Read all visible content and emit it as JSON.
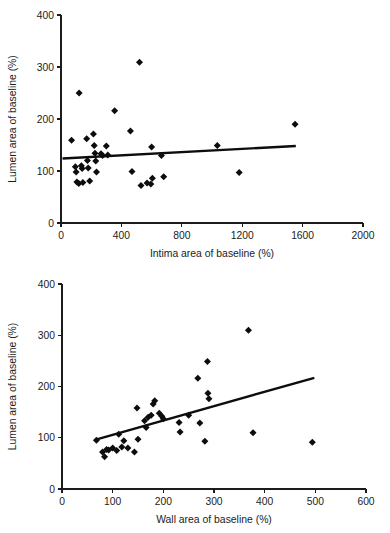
{
  "figure": {
    "title": "",
    "background": "#ffffff",
    "marker_color": "#0d0d0d",
    "axis_color": "#1b1b1b"
  },
  "chart_data": [
    {
      "type": "scatter",
      "title": "",
      "xlabel": "Intima area of baseline (%)",
      "ylabel": "Lumen area of baseline (%)",
      "xlim": [
        0,
        2000
      ],
      "ylim": [
        0,
        400
      ],
      "xticks": [
        0,
        400,
        800,
        1200,
        1600,
        2000
      ],
      "yticks": [
        0,
        100,
        200,
        300,
        400
      ],
      "xticklabels": [
        "0",
        "400",
        "800",
        "1200",
        "1600",
        "2000"
      ],
      "yticklabels": [
        "0",
        "100",
        "200",
        "300",
        "400"
      ],
      "grid": false,
      "legend": null,
      "marker": "diamond",
      "points": [
        [
          70,
          159
        ],
        [
          95,
          108
        ],
        [
          100,
          98
        ],
        [
          105,
          79
        ],
        [
          118,
          76
        ],
        [
          120,
          250
        ],
        [
          135,
          110
        ],
        [
          140,
          105
        ],
        [
          145,
          78
        ],
        [
          170,
          162
        ],
        [
          175,
          120
        ],
        [
          180,
          106
        ],
        [
          190,
          81
        ],
        [
          215,
          171
        ],
        [
          220,
          149
        ],
        [
          225,
          134
        ],
        [
          230,
          119
        ],
        [
          235,
          98
        ],
        [
          265,
          133
        ],
        [
          275,
          130
        ],
        [
          300,
          148
        ],
        [
          310,
          131
        ],
        [
          355,
          216
        ],
        [
          460,
          177
        ],
        [
          470,
          99
        ],
        [
          520,
          309
        ],
        [
          530,
          72
        ],
        [
          570,
          77
        ],
        [
          595,
          75
        ],
        [
          600,
          146
        ],
        [
          605,
          86
        ],
        [
          665,
          130
        ],
        [
          680,
          89
        ],
        [
          1035,
          149
        ],
        [
          1180,
          97
        ],
        [
          1550,
          190
        ]
      ],
      "trendline": {
        "x0": 10,
        "y0": 124,
        "x1": 1555,
        "y1": 148
      }
    },
    {
      "type": "scatter",
      "title": "",
      "xlabel": "Wall area of baseline (%)",
      "ylabel": "Lumen area of baseline (%)",
      "xlim": [
        0,
        600
      ],
      "ylim": [
        0,
        400
      ],
      "xticks": [
        0,
        100,
        200,
        300,
        400,
        500,
        600
      ],
      "yticks": [
        0,
        100,
        200,
        300,
        400
      ],
      "xticklabels": [
        "0",
        "100",
        "200",
        "300",
        "400",
        "500",
        "600"
      ],
      "yticklabels": [
        "0",
        "100",
        "200",
        "300",
        "400"
      ],
      "grid": false,
      "legend": null,
      "marker": "diamond",
      "points": [
        [
          68,
          95
        ],
        [
          80,
          72
        ],
        [
          84,
          63
        ],
        [
          88,
          77
        ],
        [
          92,
          76
        ],
        [
          100,
          80
        ],
        [
          108,
          75
        ],
        [
          112,
          107
        ],
        [
          118,
          82
        ],
        [
          122,
          94
        ],
        [
          130,
          80
        ],
        [
          143,
          72
        ],
        [
          148,
          158
        ],
        [
          150,
          97
        ],
        [
          163,
          133
        ],
        [
          166,
          120
        ],
        [
          170,
          140
        ],
        [
          176,
          144
        ],
        [
          180,
          166
        ],
        [
          183,
          172
        ],
        [
          192,
          148
        ],
        [
          197,
          142
        ],
        [
          200,
          137
        ],
        [
          231,
          130
        ],
        [
          233,
          111
        ],
        [
          250,
          144
        ],
        [
          268,
          216
        ],
        [
          272,
          129
        ],
        [
          282,
          93
        ],
        [
          287,
          249
        ],
        [
          288,
          187
        ],
        [
          290,
          176
        ],
        [
          368,
          310
        ],
        [
          377,
          110
        ],
        [
          494,
          91
        ]
      ],
      "trendline": {
        "x0": 65,
        "y0": 96,
        "x1": 498,
        "y1": 217
      }
    }
  ]
}
